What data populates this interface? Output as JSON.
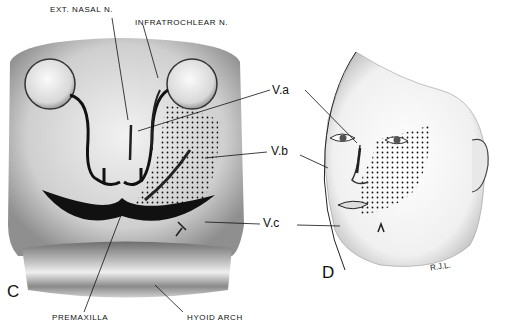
{
  "figure": {
    "panels": [
      {
        "id": "C",
        "label": "C",
        "subject": "embryonic face"
      },
      {
        "id": "D",
        "label": "D",
        "subject": "adult face"
      }
    ],
    "labels": {
      "ext_nasal": "EXT. NASAL N.",
      "infratrochlear": "INFRATROCHLEAR N.",
      "va": "V.a",
      "vb": "V.b",
      "vc": "V.c",
      "premaxilla": "PREMAXILLA",
      "hyoid_arch": "HYOID ARCH"
    },
    "signature": "R.J.L.",
    "colors": {
      "ink": "#111111",
      "shade": "#8a8a8a",
      "background": "#ffffff"
    }
  }
}
